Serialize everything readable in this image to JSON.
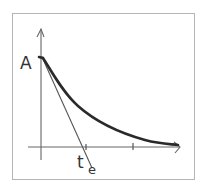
{
  "diagram": {
    "type": "exponential-decay-with-tangent",
    "labels": {
      "y_intercept": "A",
      "tangent_intercept": "t",
      "tangent_intercept_subscript": "e"
    },
    "axes": {
      "x_axis": {
        "arrow": true,
        "ticks": 2
      },
      "y_axis": {
        "arrow": true
      }
    },
    "curve": {
      "description": "decaying curve starting at A on y-axis, approaching x-axis asymptotically",
      "color": "#2a2a2a"
    },
    "tangent": {
      "description": "tangent line at t=0 intersecting x-axis at t_e",
      "color": "#555555"
    },
    "frame_color": "#b5b5b5"
  }
}
